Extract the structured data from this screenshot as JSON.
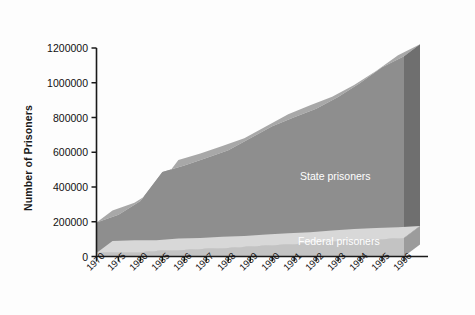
{
  "chart_data": {
    "type": "area",
    "title": "",
    "subtitle": "",
    "xlabel": "",
    "ylabel": "Number of Prisoners",
    "stacked": true,
    "grid": false,
    "legend_position": "inline-right",
    "ylim": [
      0,
      1200000
    ],
    "yticks": [
      0,
      200000,
      400000,
      600000,
      800000,
      1000000,
      1200000
    ],
    "ytick_labels": [
      "0",
      "200000",
      "400000",
      "600000",
      "800000",
      "1000000",
      "1200000"
    ],
    "categories": [
      "1970",
      "1975",
      "1980",
      "1985",
      "1986",
      "1987",
      "1988",
      "1989",
      "1990",
      "1991",
      "1992",
      "1993",
      "1994",
      "1995",
      "1996"
    ],
    "series": [
      {
        "name": "Federal prisoners",
        "color": "#c3c3c3",
        "values": [
          20000,
          24000,
          24000,
          35000,
          38000,
          44000,
          49000,
          58000,
          65000,
          71000,
          80000,
          89000,
          95000,
          100000,
          106000
        ]
      },
      {
        "name": "State prisoners",
        "color": "#8e8e8e",
        "values": [
          176000,
          216000,
          296000,
          451000,
          486000,
          523000,
          563000,
          622000,
          684000,
          730000,
          771000,
          829000,
          904000,
          989000,
          1047000
        ]
      }
    ],
    "annotations": [
      {
        "text": "State prisoners",
        "series": "State prisoners"
      },
      {
        "text": "Federal prisoners",
        "series": "Federal prisoners"
      }
    ]
  },
  "colors": {
    "background": "#fdfdfd",
    "axis": "#1a1a1a",
    "state_fill": "#8e8e8e",
    "state_top": "#a8a8a8",
    "state_side": "#6f6f6f",
    "federal_fill": "#c3c3c3",
    "federal_top": "#d8d8d8",
    "federal_side": "#9c9c9c",
    "label_text": "#ffffff"
  }
}
